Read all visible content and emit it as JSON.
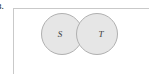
{
  "figure": {
    "label": "3.",
    "caption": "",
    "frame_border_color": "#c9c9c9",
    "background_color": "#ffffff"
  },
  "diagram": {
    "type": "venn-diagram",
    "circle_fill_color": "#e6e6e6",
    "circle_stroke_color": "#b0b0b0",
    "relation": "overlapping",
    "sets": [
      {
        "id": "S",
        "label": "S",
        "center_x": 62,
        "center_y": 34,
        "radius": 21
      },
      {
        "id": "T",
        "label": "T",
        "center_x": 97,
        "center_y": 34,
        "radius": 21
      }
    ]
  }
}
